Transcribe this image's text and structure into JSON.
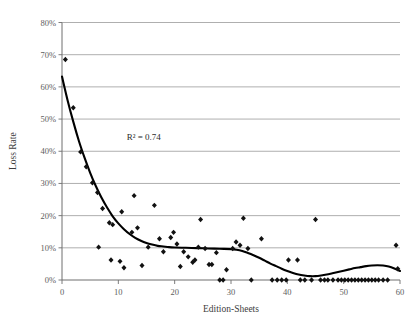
{
  "chart_data": {
    "type": "scatter",
    "title": "",
    "subtitle": "",
    "xlabel": "Edition-Sheets",
    "ylabel": "Loss Rate",
    "xlim": [
      0,
      60
    ],
    "ylim": [
      0,
      0.8
    ],
    "grid": true,
    "grid_axis": "y",
    "legend": false,
    "legend_position": "none",
    "xticks": [
      0,
      10,
      20,
      30,
      40,
      50,
      60
    ],
    "xticklabels": [
      "0",
      "10",
      "20",
      "30",
      "40",
      "50",
      "60"
    ],
    "yticks": [
      0,
      0.1,
      0.2,
      0.3,
      0.4,
      0.5,
      0.6,
      0.7,
      0.8
    ],
    "yticklabels": [
      "0%",
      "10%",
      "20%",
      "30%",
      "40%",
      "50%",
      "60%",
      "70%",
      "80%"
    ],
    "annotations": [
      {
        "text": "R² = 0.74",
        "x": 11.5,
        "y": 0.435
      }
    ],
    "series": [
      {
        "name": "Loss Rate observations",
        "type": "scatter",
        "marker": "diamond",
        "color": "#111111",
        "points": [
          [
            0.6,
            0.685
          ],
          [
            2.0,
            0.535
          ],
          [
            3.3,
            0.398
          ],
          [
            4.3,
            0.352
          ],
          [
            5.4,
            0.302
          ],
          [
            6.3,
            0.272
          ],
          [
            6.5,
            0.102
          ],
          [
            7.2,
            0.222
          ],
          [
            8.4,
            0.178
          ],
          [
            8.7,
            0.062
          ],
          [
            9.0,
            0.172
          ],
          [
            10.3,
            0.058
          ],
          [
            10.6,
            0.212
          ],
          [
            11.0,
            0.038
          ],
          [
            12.4,
            0.148
          ],
          [
            12.8,
            0.262
          ],
          [
            13.4,
            0.162
          ],
          [
            14.2,
            0.045
          ],
          [
            15.3,
            0.102
          ],
          [
            16.4,
            0.232
          ],
          [
            17.3,
            0.128
          ],
          [
            18.0,
            0.088
          ],
          [
            19.3,
            0.132
          ],
          [
            19.8,
            0.148
          ],
          [
            20.4,
            0.112
          ],
          [
            21.0,
            0.042
          ],
          [
            21.6,
            0.088
          ],
          [
            22.4,
            0.072
          ],
          [
            23.2,
            0.055
          ],
          [
            23.6,
            0.062
          ],
          [
            24.2,
            0.102
          ],
          [
            24.6,
            0.188
          ],
          [
            25.4,
            0.098
          ],
          [
            26.1,
            0.048
          ],
          [
            26.6,
            0.048
          ],
          [
            27.4,
            0.085
          ],
          [
            28.0,
            0.0
          ],
          [
            28.6,
            0.0
          ],
          [
            29.2,
            0.032
          ],
          [
            30.3,
            0.098
          ],
          [
            30.9,
            0.118
          ],
          [
            31.6,
            0.108
          ],
          [
            32.2,
            0.192
          ],
          [
            33.0,
            0.098
          ],
          [
            33.6,
            0.0
          ],
          [
            35.4,
            0.128
          ],
          [
            37.3,
            0.0
          ],
          [
            38.2,
            0.0
          ],
          [
            39.0,
            0.0
          ],
          [
            39.8,
            0.0
          ],
          [
            40.2,
            0.062
          ],
          [
            41.8,
            0.062
          ],
          [
            42.3,
            0.0
          ],
          [
            43.1,
            0.0
          ],
          [
            44.3,
            0.0
          ],
          [
            45.0,
            0.188
          ],
          [
            45.9,
            0.0
          ],
          [
            46.6,
            0.0
          ],
          [
            47.2,
            0.0
          ],
          [
            48.1,
            0.0
          ],
          [
            49.0,
            0.0
          ],
          [
            49.6,
            0.0
          ],
          [
            50.2,
            0.0
          ],
          [
            50.8,
            0.0
          ],
          [
            51.4,
            0.0
          ],
          [
            52.0,
            0.0
          ],
          [
            52.6,
            0.0
          ],
          [
            53.2,
            0.0
          ],
          [
            53.8,
            0.0
          ],
          [
            54.4,
            0.0
          ],
          [
            55.0,
            0.0
          ],
          [
            55.6,
            0.0
          ],
          [
            56.2,
            0.0
          ],
          [
            57.0,
            0.0
          ],
          [
            57.8,
            0.0
          ],
          [
            59.3,
            0.108
          ],
          [
            59.6,
            0.035
          ]
        ]
      },
      {
        "name": "Fitted trend",
        "type": "line",
        "color": "#000000",
        "points": [
          [
            0.0,
            0.632
          ],
          [
            1.0,
            0.558
          ],
          [
            2.0,
            0.492
          ],
          [
            3.0,
            0.432
          ],
          [
            4.0,
            0.38
          ],
          [
            5.0,
            0.333
          ],
          [
            6.0,
            0.292
          ],
          [
            7.0,
            0.256
          ],
          [
            8.0,
            0.225
          ],
          [
            9.0,
            0.198
          ],
          [
            10.0,
            0.176
          ],
          [
            11.0,
            0.158
          ],
          [
            12.0,
            0.143
          ],
          [
            13.0,
            0.131
          ],
          [
            14.0,
            0.122
          ],
          [
            15.0,
            0.115
          ],
          [
            16.0,
            0.11
          ],
          [
            17.0,
            0.106
          ],
          [
            18.0,
            0.104
          ],
          [
            19.0,
            0.102
          ],
          [
            20.0,
            0.101
          ],
          [
            22.0,
            0.1
          ],
          [
            24.0,
            0.099
          ],
          [
            26.0,
            0.098
          ],
          [
            28.0,
            0.097
          ],
          [
            30.0,
            0.096
          ],
          [
            31.0,
            0.094
          ],
          [
            32.0,
            0.09
          ],
          [
            33.0,
            0.084
          ],
          [
            34.0,
            0.077
          ],
          [
            35.0,
            0.069
          ],
          [
            36.0,
            0.06
          ],
          [
            37.0,
            0.051
          ],
          [
            38.0,
            0.043
          ],
          [
            39.0,
            0.035
          ],
          [
            40.0,
            0.028
          ],
          [
            41.0,
            0.022
          ],
          [
            42.0,
            0.017
          ],
          [
            43.0,
            0.014
          ],
          [
            44.0,
            0.012
          ],
          [
            45.0,
            0.012
          ],
          [
            46.0,
            0.014
          ],
          [
            47.0,
            0.017
          ],
          [
            48.0,
            0.021
          ],
          [
            49.0,
            0.025
          ],
          [
            50.0,
            0.029
          ],
          [
            51.0,
            0.033
          ],
          [
            52.0,
            0.037
          ],
          [
            53.0,
            0.04
          ],
          [
            54.0,
            0.043
          ],
          [
            55.0,
            0.045
          ],
          [
            56.0,
            0.046
          ],
          [
            57.0,
            0.045
          ],
          [
            58.0,
            0.042
          ],
          [
            59.0,
            0.036
          ],
          [
            60.0,
            0.028
          ]
        ]
      }
    ]
  },
  "colors": {
    "marker": "#111111",
    "trend": "#000000",
    "grid": "#9a9a9a",
    "axis": "#6e6e6e",
    "tick_text": "#5d5d5d",
    "background": "#ffffff"
  }
}
